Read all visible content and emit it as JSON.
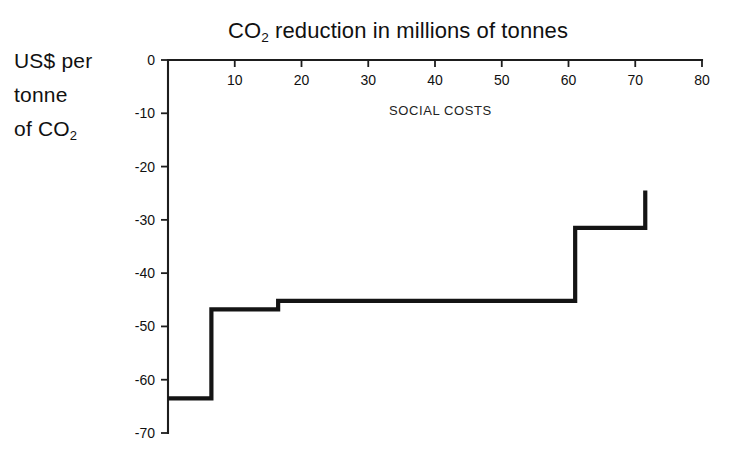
{
  "chart_data": {
    "type": "line",
    "subtype": "step",
    "title": "CO2 reduction in millions of tonnes",
    "title_parts": {
      "pre": "CO",
      "sub": "2",
      "post": " reduction in millions of tonnes"
    },
    "xlabel": "CO2 reduction in millions of tonnes",
    "ylabel": "US$ per tonne of CO2",
    "ylabel_lines": [
      "US$ per",
      "tonne",
      "of CO"
    ],
    "ylabel_sub": "2",
    "annotations": [
      {
        "text": "SOCIAL COSTS",
        "x": 33,
        "y": -8
      }
    ],
    "xlim": [
      0,
      80
    ],
    "ylim": [
      -70,
      0
    ],
    "xticks": [
      0,
      10,
      20,
      30,
      40,
      50,
      60,
      70,
      80
    ],
    "xticklabels": [
      "",
      "10",
      "20",
      "30",
      "40",
      "50",
      "60",
      "70",
      "80"
    ],
    "yticks": [
      0,
      -10,
      -20,
      -30,
      -40,
      -50,
      -60,
      -70
    ],
    "yticklabels": [
      "0",
      "-10",
      "-20",
      "-30",
      "-40",
      "-50",
      "-60",
      "-70"
    ],
    "grid": false,
    "legend": false,
    "axis_position": {
      "x": "top",
      "y": "left"
    },
    "line_color": "#141414",
    "steps": [
      {
        "x_start": 0.0,
        "x_end": 6.5,
        "value": -63.5
      },
      {
        "x_start": 6.5,
        "x_end": 16.5,
        "value": -46.8
      },
      {
        "x_start": 16.5,
        "x_end": 61.0,
        "value": -45.2
      },
      {
        "x_start": 61.0,
        "x_end": 71.5,
        "value": -31.5
      },
      {
        "x_start": 71.5,
        "x_end": 71.5,
        "value": -24.5
      }
    ],
    "x": [
      0,
      6.5,
      6.5,
      16.5,
      16.5,
      61.0,
      61.0,
      71.5,
      71.5
    ],
    "y": [
      -63.5,
      -63.5,
      -46.8,
      -46.8,
      -45.2,
      -45.2,
      -31.5,
      -31.5,
      -24.5
    ]
  }
}
